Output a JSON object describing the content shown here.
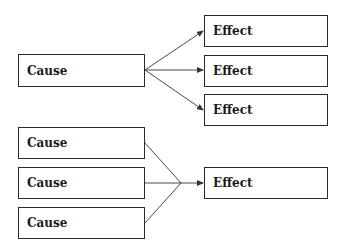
{
  "diagrams": [
    {
      "name": "one-cause-many-effects",
      "causes": [
        {
          "label": "Cause",
          "x": 18,
          "y": 54,
          "w": 127,
          "h": 33
        }
      ],
      "effects": [
        {
          "label": "Effect",
          "x": 204,
          "y": 15,
          "w": 124,
          "h": 32
        },
        {
          "label": "Effect",
          "x": 204,
          "y": 55,
          "w": 124,
          "h": 32
        },
        {
          "label": "Effect",
          "x": 204,
          "y": 94,
          "w": 124,
          "h": 32
        }
      ]
    },
    {
      "name": "many-causes-one-effect",
      "causes": [
        {
          "label": "Cause",
          "x": 18,
          "y": 127,
          "w": 127,
          "h": 32
        },
        {
          "label": "Cause",
          "x": 18,
          "y": 167,
          "w": 127,
          "h": 32
        },
        {
          "label": "Cause",
          "x": 18,
          "y": 207,
          "w": 127,
          "h": 32
        }
      ],
      "effects": [
        {
          "label": "Effect",
          "x": 204,
          "y": 167,
          "w": 124,
          "h": 32
        }
      ]
    }
  ],
  "colors": {
    "line": "#333333",
    "border": "#2a2a2a",
    "text": "#1a1a1a"
  }
}
